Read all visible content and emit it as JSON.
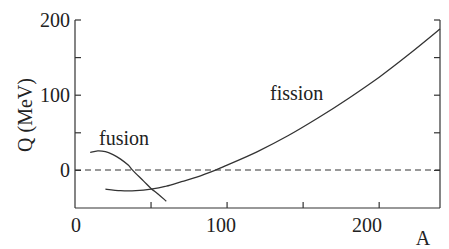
{
  "chart_data": {
    "type": "line",
    "title": "",
    "xlabel": "A",
    "ylabel": "Q (MeV)",
    "xlim": [
      0,
      240
    ],
    "ylim": [
      -50,
      200
    ],
    "grid": false,
    "legend": null,
    "x_ticks": [
      0,
      50,
      100,
      150,
      200
    ],
    "x_tick_labels": [
      "0",
      "100",
      "200"
    ],
    "y_ticks": [
      -50,
      0,
      50,
      100,
      150,
      200
    ],
    "y_tick_labels": [
      "0",
      "100",
      "200"
    ],
    "reference_line": {
      "y": 0,
      "style": "dashed"
    },
    "series": [
      {
        "name": "fusion",
        "x": [
          10,
          15,
          20,
          25,
          30,
          35,
          38,
          45,
          50,
          55,
          60
        ],
        "y": [
          24,
          26,
          25,
          21,
          15,
          7,
          0,
          -14,
          -24,
          -32,
          -41
        ]
      },
      {
        "name": "fission",
        "x": [
          20,
          30,
          40,
          50,
          60,
          70,
          80,
          92,
          100,
          120,
          140,
          160,
          180,
          200,
          220,
          240
        ],
        "y": [
          -25,
          -27,
          -27,
          -25,
          -21,
          -15,
          -9,
          0,
          7,
          25,
          46,
          70,
          96,
          124,
          155,
          188
        ]
      }
    ],
    "annotations": [
      {
        "text": "fusion",
        "x": 15,
        "y": 40
      },
      {
        "text": "fission",
        "x": 130,
        "y": 85
      }
    ]
  },
  "labels": {
    "ylabel": "Q (MeV)",
    "xlabel": "A",
    "fusion": "fusion",
    "fission": "fission",
    "xt0": "0",
    "xt100": "100",
    "xt200": "200",
    "yt0": "0",
    "yt100": "100",
    "yt200": "200"
  }
}
